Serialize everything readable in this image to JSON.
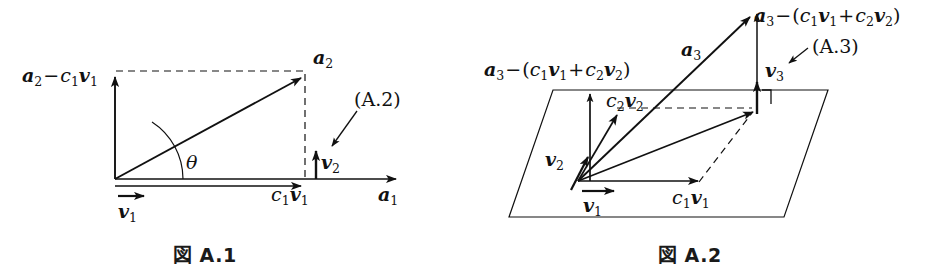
{
  "figures": [
    {
      "id": "fig-a1",
      "caption": "図 A.1",
      "eq_ref": "(A.2)",
      "angle_symbol": "θ",
      "labels": {
        "a1": "a1",
        "a2": "a2",
        "v1": "v1",
        "v2": "v2",
        "c1v1": "c1v1",
        "a2_minus_c1v1": "a2 − c1v1"
      },
      "vectors": [
        {
          "name": "a1",
          "label": "a1",
          "type": "solid-arrow",
          "from": [
            115,
            179
          ],
          "to": [
            400,
            179
          ]
        },
        {
          "name": "a2",
          "label": "a2",
          "type": "solid-arrow",
          "from": [
            115,
            179
          ],
          "to": [
            305,
            76
          ]
        },
        {
          "name": "c1v1",
          "label": "c1v1",
          "type": "solid-arrow",
          "from": [
            115,
            186
          ],
          "to": [
            305,
            186
          ]
        },
        {
          "name": "v1",
          "label": "v1",
          "type": "solid-arrow",
          "from": [
            118,
            196
          ],
          "to": [
            150,
            196
          ]
        },
        {
          "name": "v2",
          "label": "v2",
          "type": "solid-arrow",
          "from": [
            316,
            179
          ],
          "to": [
            316,
            147
          ]
        },
        {
          "name": "a2-minus-c1v1",
          "label": "a2 − c1v1",
          "type": "solid-arrow",
          "from": [
            115,
            179
          ],
          "to": [
            115,
            73
          ]
        }
      ],
      "dashed_lines": [
        {
          "name": "top-dashed",
          "from": [
            115,
            71
          ],
          "to": [
            305,
            71
          ]
        },
        {
          "name": "right-dashed",
          "from": [
            305,
            76
          ],
          "to": [
            305,
            181
          ]
        }
      ]
    },
    {
      "id": "fig-a2",
      "caption": "図 A.2",
      "eq_ref": "(A.3)",
      "labels": {
        "a3": "a3",
        "v1": "v1",
        "v2": "v2",
        "v3": "v3",
        "c1v1": "c1v1",
        "c2v2": "c2v2",
        "a3_minus_sum_left": "a3 − (c1v1 + c2v2)",
        "a3_minus_sum_top": "a3 − (c1v1 + c2v2)"
      },
      "plane": {
        "name": "span-plane",
        "corners": [
          [
            553,
            90
          ],
          [
            828,
            90
          ],
          [
            784,
            217
          ],
          [
            509,
            217
          ]
        ]
      },
      "vectors": [
        {
          "name": "a3",
          "label": "a3",
          "type": "solid-arrow",
          "from": [
            578,
            181
          ],
          "to": [
            748,
            13
          ]
        },
        {
          "name": "v1",
          "label": "v1",
          "type": "solid-arrow",
          "from": [
            582,
            191
          ],
          "to": [
            618,
            191
          ]
        },
        {
          "name": "c1v1",
          "label": "c1v1",
          "type": "solid-arrow",
          "from": [
            578,
            181
          ],
          "to": [
            702,
            181
          ]
        },
        {
          "name": "v2",
          "label": "v2",
          "type": "solid-arrow",
          "from": [
            572,
            189
          ],
          "to": [
            592,
            151
          ]
        },
        {
          "name": "c2v2",
          "label": "c2v2",
          "type": "solid-arrow",
          "from": [
            578,
            181
          ],
          "to": [
            620,
            110
          ]
        },
        {
          "name": "c1v1-plus-c2v2",
          "label": "",
          "type": "solid-arrow",
          "from": [
            578,
            181
          ],
          "to": [
            757,
            110
          ]
        },
        {
          "name": "v3",
          "label": "v3",
          "type": "solid-arrow",
          "from": [
            757,
            114
          ],
          "to": [
            757,
            79
          ]
        },
        {
          "name": "a3-minus-sum-left",
          "label": "a3 − (c1v1 + c2v2)",
          "type": "solid-arrow",
          "from": [
            590,
            181
          ],
          "to": [
            590,
            90
          ]
        }
      ],
      "dashed_lines": [
        {
          "name": "dashed-to-sum",
          "from": [
            617,
            108
          ],
          "to": [
            752,
            108
          ]
        },
        {
          "name": "dashed-c1v1-to-sum",
          "from": [
            700,
            182
          ],
          "to": [
            753,
            112
          ]
        }
      ],
      "perpendicular_marker": {
        "name": "right-angle-marker",
        "at": [
          760,
          91
        ]
      }
    }
  ]
}
